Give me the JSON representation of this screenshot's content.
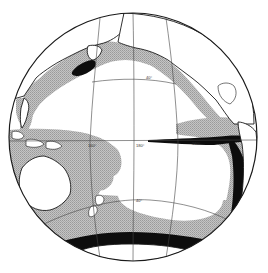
{
  "map": {
    "title": "",
    "projection": "orthographic hemisphere centered on the Pacific Ocean",
    "center_px": [
      133,
      137
    ],
    "radius_px": 124,
    "colors": {
      "background": "#ffffff",
      "ocean": "#ffffff",
      "zone_moderate": "#b8b8b8",
      "zone_high": "#0d0d0d",
      "land_outline": "#1a1a1a",
      "grid": "#444444"
    },
    "legend": {
      "zone_moderate": "stippled gray zone",
      "zone_high": "solid black zone"
    },
    "grid_labels": {
      "lon_160E": "160°",
      "lon_180": "180°",
      "lon_160W": "160°",
      "lon_120W": "120°",
      "lat_40N": "40°",
      "lat_40S": "40°",
      "lat_40S_west": "40°"
    },
    "regions": [
      "North Pacific (Kuril/Kamchatka black patch)",
      "Eastern equatorial Pacific black tongue",
      "Peru-Chile coastal black band",
      "Southern Ocean black circumpolar band",
      "Western Pacific / Indonesia gray zone",
      "Australia",
      "New Zealand",
      "Antarctica",
      "North America",
      "South America",
      "Asia / Japan"
    ]
  }
}
